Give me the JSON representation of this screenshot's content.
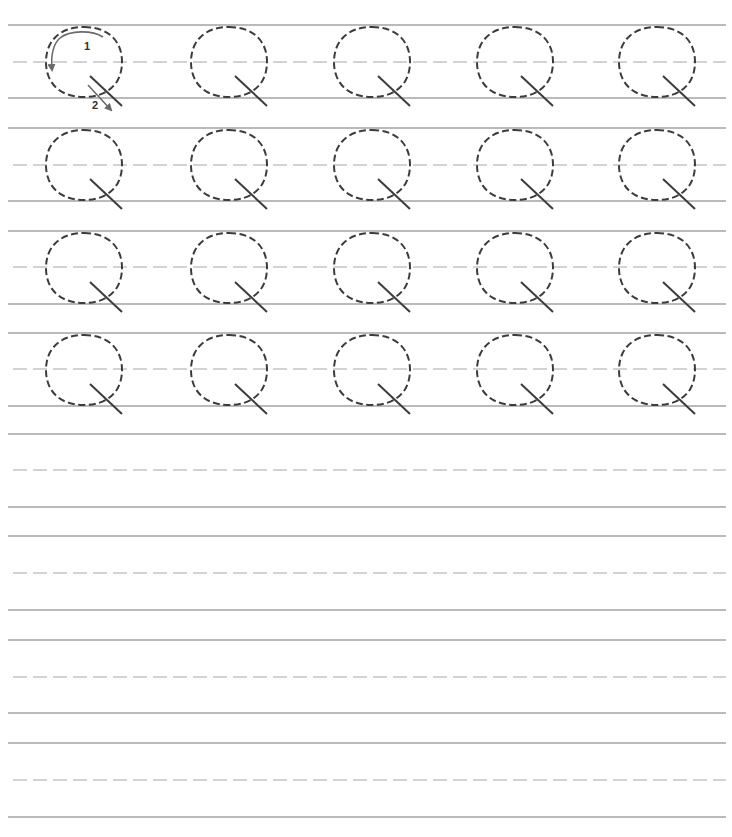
{
  "worksheet": {
    "letter": "Q",
    "letter_display": "Q",
    "colors": {
      "guide_line": "#a3a3a3",
      "midline": "#a8a8a8",
      "letter_stroke": "#3c3c3c",
      "arrow": "#6a6a6a",
      "background": "#ffffff"
    },
    "layout": {
      "line_x_start": 8,
      "line_x_end": 726,
      "row_pitch": 103,
      "rows": [
        {
          "top": 25,
          "mid": 62,
          "base": 98,
          "traced": true
        },
        {
          "top": 128,
          "mid": 165,
          "base": 201,
          "traced": true
        },
        {
          "top": 231,
          "mid": 267,
          "base": 304,
          "traced": true
        },
        {
          "top": 333,
          "mid": 369,
          "base": 406,
          "traced": true
        },
        {
          "top": 434,
          "mid": 470,
          "base": 507,
          "traced": false
        },
        {
          "top": 536,
          "mid": 573,
          "base": 610,
          "traced": false
        },
        {
          "top": 640,
          "mid": 677,
          "base": 713,
          "traced": false
        },
        {
          "top": 743,
          "mid": 780,
          "base": 817,
          "traced": false
        }
      ],
      "letter_columns_cx": [
        84,
        229,
        372,
        515,
        657
      ],
      "letter_rx": 38,
      "letter_ry": 35
    },
    "stroke_guide": {
      "step1_label": "1",
      "step2_label": "2"
    },
    "traced_rows_count": 4,
    "letters_per_row": 5,
    "blank_rows_count": 4
  }
}
